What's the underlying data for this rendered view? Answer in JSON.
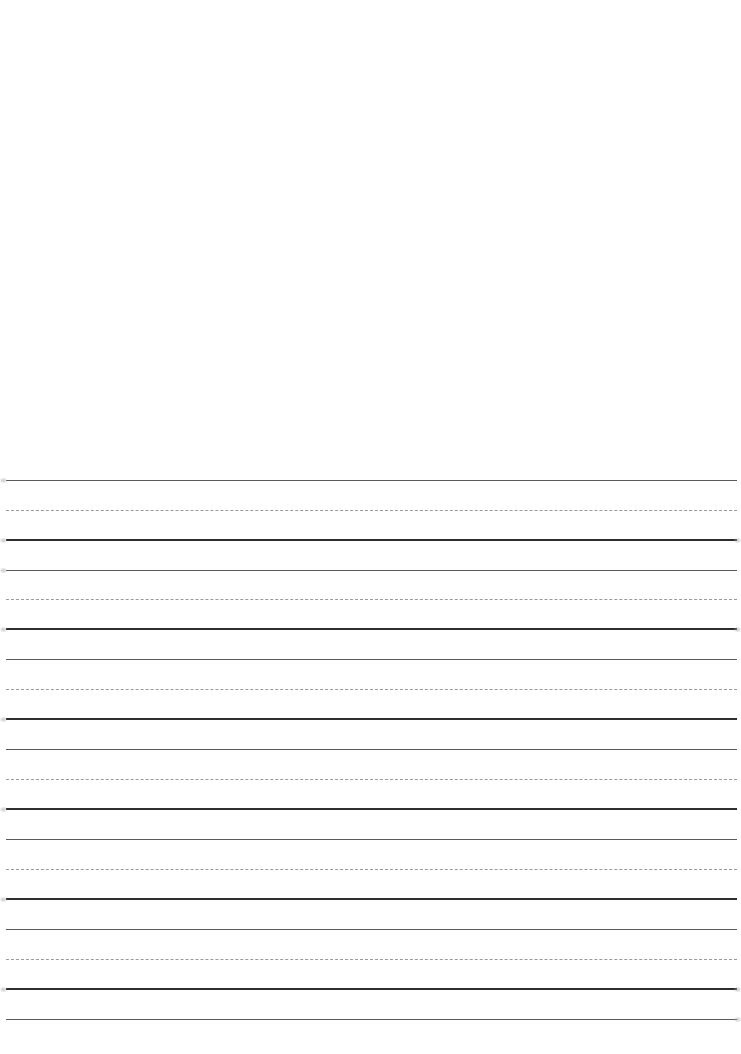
{
  "sheet": {
    "type": "handwriting-practice-paper",
    "blank_top_area": true,
    "line_colors": {
      "top_line": "#5a5a5a",
      "mid_line": "#9a9a9a",
      "base_line": "#2e2e2e",
      "paper": "#ffffff"
    },
    "line_groups": [
      {
        "top_y": 480,
        "mid_y": 510,
        "base_y": 540
      },
      {
        "top_y": 570,
        "mid_y": 599,
        "base_y": 629
      },
      {
        "top_y": 659,
        "mid_y": 689,
        "base_y": 719
      },
      {
        "top_y": 749,
        "mid_y": 779,
        "base_y": 809
      },
      {
        "top_y": 839,
        "mid_y": 869,
        "base_y": 899
      },
      {
        "top_y": 929,
        "mid_y": 959,
        "base_y": 989
      }
    ],
    "final_line_y": 1019
  }
}
